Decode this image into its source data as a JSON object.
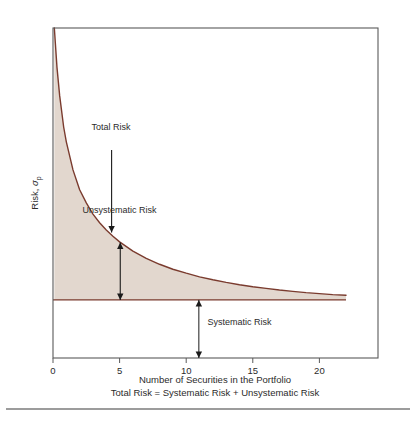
{
  "figure": {
    "name": "portfolio-risk-diversification-chart",
    "background_color": "#ffffff"
  },
  "chart_data": {
    "type": "area",
    "title": "",
    "subtitle": "",
    "xlabel": "Number of Securities in the Portfolio",
    "ylabel": "Risk, σp",
    "ylabel_main": "Risk, ",
    "ylabel_sub_base": "σ",
    "ylabel_sub_script": "p",
    "caption": "Total Risk = Systematic Risk + Unsystematic Risk",
    "xlim": [
      0,
      24.4
    ],
    "ylim": [
      0,
      100
    ],
    "grid": false,
    "legend": "none",
    "xticks": [
      0,
      5,
      10,
      15,
      20
    ],
    "xtick_labels": [
      "0",
      "5",
      "10",
      "15",
      "20"
    ],
    "yticks": [],
    "ytick_labels": [],
    "series": [
      {
        "name": "Total Risk",
        "type": "line",
        "color": "#7a3b2e",
        "x": [
          0.1,
          0.3,
          0.5,
          0.8,
          1.0,
          1.5,
          2.0,
          2.5,
          3.0,
          3.5,
          4.0,
          4.5,
          5.0,
          6.0,
          7.0,
          8.0,
          9.0,
          10.0,
          11.0,
          12.0,
          13.0,
          14.0,
          15.0,
          16.0,
          17.0,
          18.0,
          19.0,
          20.0,
          21.0,
          22.0
        ],
        "y": [
          100.0,
          88.0,
          79.5,
          70.0,
          65.5,
          57.0,
          51.0,
          47.0,
          43.6,
          41.0,
          38.8,
          36.9,
          35.2,
          32.4,
          30.2,
          28.4,
          26.9,
          25.7,
          24.6,
          23.7,
          22.9,
          22.2,
          21.6,
          21.1,
          20.6,
          20.2,
          19.8,
          19.5,
          19.2,
          19.0
        ]
      },
      {
        "name": "Systematic Risk Floor",
        "type": "line",
        "color": "#7a3b2e",
        "x": [
          0.0,
          22.0
        ],
        "y": [
          17.6,
          17.6
        ]
      }
    ],
    "fill": {
      "name": "Unsystematic Risk Region",
      "between": [
        "Total Risk",
        "Systematic Risk Floor"
      ],
      "color": "#e2d7ce"
    },
    "annotations": [
      {
        "id": "total-risk",
        "label": "Total Risk",
        "label_x": 4.35,
        "label_y": 69.0,
        "arrow": "single-down",
        "arrow_x": 4.4,
        "arrow_y_from": 63.0,
        "arrow_y_to": 38.0
      },
      {
        "id": "unsystematic-risk",
        "label": "Unsystematic Risk",
        "label_x": 5.0,
        "label_y": 44.0,
        "arrow": "double-vertical",
        "arrow_x": 5.05,
        "arrow_y_from": 35.0,
        "arrow_y_to": 17.6
      },
      {
        "id": "systematic-risk",
        "label": "Systematic Risk",
        "label_x": 11.6,
        "label_y": 10.0,
        "arrow": "double-vertical",
        "arrow_x": 10.95,
        "arrow_y_from": 17.6,
        "arrow_y_to": 0.0
      }
    ]
  },
  "colors": {
    "fill": "#e2d7ce",
    "curve": "#7a3b2e",
    "frame": "#5a5a5a",
    "text": "#2b2b2b",
    "arrow": "#1a1a1a",
    "rule": "#3a3a3a"
  }
}
